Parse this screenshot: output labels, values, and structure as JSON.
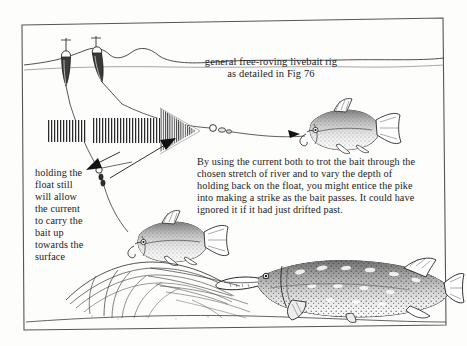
{
  "figure": {
    "kind": "pen-and-ink fishing instructional illustration",
    "border_color": "#4a4a4a",
    "ink_color": "#1b1b1b",
    "paper_color": "#fdfdfc"
  },
  "annotations": {
    "title": "general free-roving livebait rig\nas detailed in Fig 76",
    "body": "By using the current both to trot the bait through the chosen stretch of river and to vary the depth of holding back on the float, you might entice the pike into making a strike as the bait passes. It could have ignored it if it had just drifted past.",
    "left_caption": "holding the\nfloat still\nwill allow\nthe current\nto carry the\nbait up\ntowards the\nsurface"
  },
  "scene": {
    "water_surface_label": "water-surface-line",
    "float_left_label": "fishing-float-left",
    "float_right_label": "fishing-float-right",
    "current_arrow_label": "current-flow-arrow",
    "livebait_upper_label": "livebait-fish-upper",
    "livebait_lower_label": "livebait-fish-lower",
    "pike_label": "pike-fish",
    "weed_label": "riverbed-weed-bed",
    "swivel_label": "swivel-and-bead",
    "shot_label": "split-shot-weights",
    "line_label": "fishing-line"
  }
}
